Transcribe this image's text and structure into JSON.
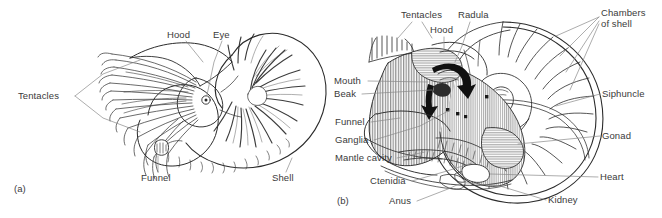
{
  "figure": {
    "background_color": "#ffffff",
    "ink_color": "#2b2b2b",
    "leader_color": "#8a8a8a",
    "panels": [
      {
        "id": "a",
        "id_label": "(a)",
        "caption": "External lateral view of Nautilus",
        "labels": [
          {
            "key": "tentacles",
            "text": "Tentacles"
          },
          {
            "key": "hood",
            "text": "Hood"
          },
          {
            "key": "eye",
            "text": "Eye"
          },
          {
            "key": "funnel",
            "text": "Funnel"
          },
          {
            "key": "shell",
            "text": "Shell"
          }
        ]
      },
      {
        "id": "b",
        "id_label": "(b)",
        "caption": "Sagittal section showing internal anatomy and chambered shell",
        "labels": [
          {
            "key": "tentacles",
            "text": "Tentacles"
          },
          {
            "key": "radula",
            "text": "Radula"
          },
          {
            "key": "hood",
            "text": "Hood"
          },
          {
            "key": "chambers_of_shell_1",
            "text": "Chambers"
          },
          {
            "key": "chambers_of_shell_2",
            "text": "of shell"
          },
          {
            "key": "mouth",
            "text": "Mouth"
          },
          {
            "key": "beak",
            "text": "Beak"
          },
          {
            "key": "funnel",
            "text": "Funnel"
          },
          {
            "key": "ganglia",
            "text": "Ganglia"
          },
          {
            "key": "mantle_cavity",
            "text": "Mantle cavity"
          },
          {
            "key": "ctenidia",
            "text": "Ctenidia"
          },
          {
            "key": "anus",
            "text": "Anus"
          },
          {
            "key": "siphuncle",
            "text": "Siphuncle"
          },
          {
            "key": "gonad",
            "text": "Gonad"
          },
          {
            "key": "heart",
            "text": "Heart"
          },
          {
            "key": "kidney",
            "text": "Kidney"
          }
        ]
      }
    ]
  }
}
